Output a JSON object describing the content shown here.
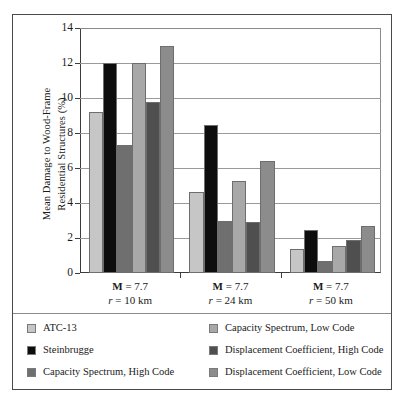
{
  "chart_data": {
    "type": "bar",
    "title": "",
    "xlabel": "",
    "ylabel": "Mean Damage to Wood-Frame Residential Structures (%)",
    "ylabel_lines": [
      "Mean Damage to Wood-Frame",
      "Residential Structures (%)"
    ],
    "ylim": [
      0,
      14
    ],
    "yticks": [
      0,
      2,
      4,
      6,
      8,
      10,
      12,
      14
    ],
    "ytick_labels": [
      "0",
      "2",
      "4",
      "6",
      "8",
      "10",
      "12",
      "14"
    ],
    "grid": true,
    "legend_position": "below-plot",
    "categories": [
      "M = 7.7\nr = 10 km",
      "M = 7.7\nr = 24 km",
      "M = 7.7\nr = 50 km"
    ],
    "category_labels": [
      {
        "magnitude_prefix": "M",
        "magnitude_eq": " = 7.7",
        "distance_prefix": "r",
        "distance_eq": " = 10 km"
      },
      {
        "magnitude_prefix": "M",
        "magnitude_eq": " = 7.7",
        "distance_prefix": "r",
        "distance_eq": " = 24 km"
      },
      {
        "magnitude_prefix": "M",
        "magnitude_eq": " = 7.7",
        "distance_prefix": "r",
        "distance_eq": " = 50 km"
      }
    ],
    "series": [
      {
        "name": "ATC-13",
        "color": "#c6c6c6",
        "values": [
          9.2,
          4.65,
          1.4
        ]
      },
      {
        "name": "Steinbrugge",
        "color": "#0d0d0d",
        "values": [
          12.0,
          8.45,
          2.45
        ]
      },
      {
        "name": "Capacity Spectrum, High Code",
        "color": "#6f6f6f",
        "values": [
          7.3,
          3.0,
          0.7
        ]
      },
      {
        "name": "Capacity Spectrum, Low Code",
        "color": "#a8a8a8",
        "values": [
          12.0,
          5.25,
          1.55
        ]
      },
      {
        "name": "Displacement Coefficient, High Code",
        "color": "#4f4f4f",
        "values": [
          9.8,
          2.9,
          1.9
        ]
      },
      {
        "name": "Displacement Coefficient, Low Code",
        "color": "#8c8c8c",
        "values": [
          13.0,
          6.4,
          2.7
        ]
      }
    ]
  },
  "legend": {
    "items": [
      {
        "label": "ATC-13",
        "color": "#c6c6c6"
      },
      {
        "label": "Steinbrugge",
        "color": "#0d0d0d"
      },
      {
        "label": "Capacity Spectrum, High Code",
        "color": "#6f6f6f"
      },
      {
        "label": "Capacity Spectrum, Low Code",
        "color": "#a8a8a8"
      },
      {
        "label": "Displacement Coefficient, High Code",
        "color": "#4f4f4f"
      },
      {
        "label": "Displacement Coefficient, Low Code",
        "color": "#8c8c8c"
      }
    ]
  }
}
